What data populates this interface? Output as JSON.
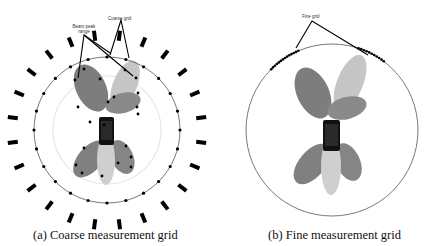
{
  "panels": [
    {
      "id": "a",
      "caption": "(a) Coarse measurement grid",
      "labels": {
        "beam_peak": "Beam peak",
        "beam_peak_line2": "range",
        "coarse_grid": "Coarse grid"
      }
    },
    {
      "id": "b",
      "caption": "(b) Fine measurement grid",
      "labels": {
        "fine_grid": "Fine grid"
      }
    }
  ],
  "colors": {
    "lobe_dark": "#7f7f7f",
    "lobe_light": "#c4c4c4",
    "phone": "#111111",
    "grid_point": "#000000",
    "circle": "#555555",
    "inner_circle": "#e4e4e4"
  }
}
